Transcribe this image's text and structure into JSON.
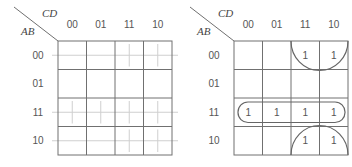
{
  "maps": [
    {
      "id": "left",
      "row_var": "AB",
      "col_var": "CD",
      "col_labels": [
        "00",
        "01",
        "11",
        "10"
      ],
      "row_labels": [
        "00",
        "01",
        "11",
        "10"
      ],
      "cells": [
        [
          "",
          "",
          "",
          ""
        ],
        [
          "",
          "",
          "",
          ""
        ],
        [
          "",
          "",
          "",
          ""
        ],
        [
          "",
          "",
          "",
          ""
        ]
      ],
      "guide_cells": [
        [
          0,
          2
        ],
        [
          0,
          3
        ],
        [
          2,
          0
        ],
        [
          2,
          1
        ],
        [
          2,
          2
        ],
        [
          2,
          3
        ],
        [
          3,
          2
        ],
        [
          3,
          3
        ]
      ],
      "guide_rows": [
        0,
        2,
        3
      ]
    },
    {
      "id": "right",
      "row_var": "AB",
      "col_var": "CD",
      "col_labels": [
        "00",
        "01",
        "11",
        "10"
      ],
      "row_labels": [
        "00",
        "01",
        "11",
        "10"
      ],
      "cells": [
        [
          "",
          "",
          "1",
          "1"
        ],
        [
          "",
          "",
          "",
          ""
        ],
        [
          "1",
          "1",
          "1",
          "1"
        ],
        [
          "",
          "",
          "1",
          "1"
        ]
      ],
      "groups": [
        {
          "type": "half-ellipse-top",
          "row": 0,
          "cols": [
            2,
            3
          ]
        },
        {
          "type": "pill",
          "row": 2,
          "cols": [
            0,
            3
          ]
        },
        {
          "type": "half-ellipse-bottom",
          "row": 3,
          "cols": [
            2,
            3
          ]
        }
      ]
    }
  ]
}
